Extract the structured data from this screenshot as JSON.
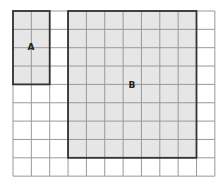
{
  "diagram": {
    "grid": {
      "origin_x": 13,
      "origin_y": 11,
      "cols": 11,
      "rows": 9,
      "cell": 18.35,
      "line_color": "#999999",
      "background": "#ffffff"
    },
    "rectangles": [
      {
        "id": "A",
        "label": "A",
        "col": 0,
        "row": 0,
        "width_cells": 2,
        "height_cells": 4,
        "fill": "#e6e6e6",
        "stroke": "#333333",
        "label_x": 31,
        "label_y": 50
      },
      {
        "id": "B",
        "label": "B",
        "col": 3,
        "row": 0,
        "width_cells": 7,
        "height_cells": 8,
        "fill": "#e6e6e6",
        "stroke": "#333333",
        "label_x": 132,
        "label_y": 88
      }
    ]
  }
}
